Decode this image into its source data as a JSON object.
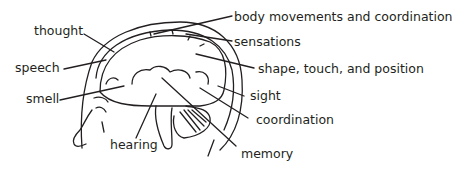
{
  "diagram": {
    "labels": {
      "thought": "thought",
      "speech": "speech",
      "smell": "smell",
      "hearing": "hearing",
      "body_movements": "body movements and coordination",
      "sensations": "sensations",
      "shape": "shape, touch, and position",
      "sight": "sight",
      "coordination": "coordination",
      "memory": "memory"
    },
    "colors": {
      "ink": "#231f20",
      "background": "#ffffff"
    }
  }
}
